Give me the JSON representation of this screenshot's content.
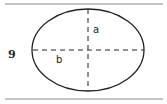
{
  "diagram": {
    "figure_number": "9",
    "labels": {
      "semi_minor_axis": "a",
      "semi_major_axis": "b"
    },
    "colors": {
      "stroke": "#222222",
      "rule": "#888888",
      "background": "#ffffff"
    }
  }
}
